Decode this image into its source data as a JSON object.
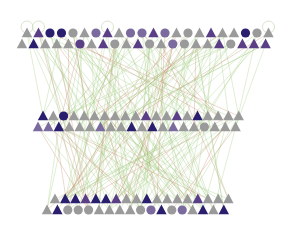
{
  "diagram": {
    "type": "multi-layer network graph",
    "width": 296,
    "height": 230,
    "background": "#ffffff",
    "colors": {
      "gray": "#9a9a9a",
      "light_purple": "#7b6a9e",
      "purple": "#5a3f86",
      "navy": "#2a1f6e",
      "edge_green": "#a8cf8a",
      "edge_red": "#c98b6a",
      "self_loop": "#c8d9b8"
    },
    "layers": [
      {
        "name": "top",
        "rows": [
          {
            "y": 33,
            "x_start": 27,
            "x_step": 11.5,
            "nodes": [
              {
                "shape": "triangle",
                "color": "gray",
                "loop": true
              },
              {
                "shape": "triangle",
                "color": "purple",
                "loop": true
              },
              {
                "shape": "circle",
                "color": "navy"
              },
              {
                "shape": "circle",
                "color": "navy"
              },
              {
                "shape": "circle",
                "color": "gray"
              },
              {
                "shape": "triangle",
                "color": "gray"
              },
              {
                "shape": "circle",
                "color": "light_purple"
              },
              {
                "shape": "triangle",
                "color": "purple",
                "loop": true
              },
              {
                "shape": "triangle",
                "color": "gray"
              },
              {
                "shape": "circle",
                "color": "light_purple"
              },
              {
                "shape": "circle",
                "color": "light_purple"
              },
              {
                "shape": "triangle",
                "color": "purple"
              },
              {
                "shape": "circle",
                "color": "light_purple"
              },
              {
                "shape": "triangle",
                "color": "gray"
              },
              {
                "shape": "circle",
                "color": "gray"
              },
              {
                "shape": "triangle",
                "color": "gray"
              },
              {
                "shape": "triangle",
                "color": "purple"
              },
              {
                "shape": "triangle",
                "color": "gray"
              },
              {
                "shape": "triangle",
                "color": "gray"
              },
              {
                "shape": "circle",
                "color": "navy"
              },
              {
                "shape": "circle",
                "color": "gray"
              },
              {
                "shape": "triangle",
                "color": "gray",
                "loop": true
              }
            ]
          },
          {
            "y": 44,
            "x_start": 22,
            "x_step": 11.6,
            "nodes": [
              {
                "shape": "triangle",
                "color": "gray"
              },
              {
                "shape": "triangle",
                "color": "navy"
              },
              {
                "shape": "triangle",
                "color": "gray"
              },
              {
                "shape": "triangle",
                "color": "gray"
              },
              {
                "shape": "triangle",
                "color": "gray"
              },
              {
                "shape": "circle",
                "color": "purple"
              },
              {
                "shape": "triangle",
                "color": "gray"
              },
              {
                "shape": "triangle",
                "color": "purple"
              },
              {
                "shape": "circle",
                "color": "gray"
              },
              {
                "shape": "triangle",
                "color": "gray"
              },
              {
                "shape": "triangle",
                "color": "purple"
              },
              {
                "shape": "circle",
                "color": "gray"
              },
              {
                "shape": "triangle",
                "color": "gray"
              },
              {
                "shape": "circle",
                "color": "light_purple"
              },
              {
                "shape": "circle",
                "color": "gray"
              },
              {
                "shape": "triangle",
                "color": "gray"
              },
              {
                "shape": "triangle",
                "color": "gray"
              },
              {
                "shape": "triangle",
                "color": "purple"
              },
              {
                "shape": "circle",
                "color": "gray"
              },
              {
                "shape": "triangle",
                "color": "purple"
              },
              {
                "shape": "triangle",
                "color": "purple"
              },
              {
                "shape": "triangle",
                "color": "purple"
              }
            ]
          }
        ]
      },
      {
        "name": "middle",
        "rows": [
          {
            "y": 116,
            "x_start": 43,
            "x_step": 10.3,
            "nodes": [
              {
                "shape": "triangle",
                "color": "navy"
              },
              {
                "shape": "triangle",
                "color": "gray"
              },
              {
                "shape": "circle",
                "color": "navy"
              },
              {
                "shape": "triangle",
                "color": "gray"
              },
              {
                "shape": "triangle",
                "color": "gray"
              },
              {
                "shape": "triangle",
                "color": "gray"
              },
              {
                "shape": "triangle",
                "color": "gray"
              },
              {
                "shape": "triangle",
                "color": "gray"
              },
              {
                "shape": "triangle",
                "color": "gray"
              },
              {
                "shape": "triangle",
                "color": "gray"
              },
              {
                "shape": "triangle",
                "color": "purple"
              },
              {
                "shape": "triangle",
                "color": "gray"
              },
              {
                "shape": "triangle",
                "color": "gray"
              },
              {
                "shape": "triangle",
                "color": "purple"
              },
              {
                "shape": "triangle",
                "color": "gray"
              },
              {
                "shape": "triangle",
                "color": "navy"
              },
              {
                "shape": "triangle",
                "color": "gray"
              },
              {
                "shape": "triangle",
                "color": "gray"
              },
              {
                "shape": "triangle",
                "color": "gray"
              },
              {
                "shape": "triangle",
                "color": "gray"
              }
            ]
          },
          {
            "y": 127,
            "x_start": 38,
            "x_step": 10.4,
            "nodes": [
              {
                "shape": "triangle",
                "color": "light_purple"
              },
              {
                "shape": "triangle",
                "color": "light_purple"
              },
              {
                "shape": "triangle",
                "color": "navy"
              },
              {
                "shape": "triangle",
                "color": "gray"
              },
              {
                "shape": "triangle",
                "color": "gray"
              },
              {
                "shape": "triangle",
                "color": "gray"
              },
              {
                "shape": "triangle",
                "color": "light_purple"
              },
              {
                "shape": "triangle",
                "color": "gray"
              },
              {
                "shape": "triangle",
                "color": "gray"
              },
              {
                "shape": "triangle",
                "color": "navy"
              },
              {
                "shape": "triangle",
                "color": "gray"
              },
              {
                "shape": "triangle",
                "color": "navy"
              },
              {
                "shape": "triangle",
                "color": "gray"
              },
              {
                "shape": "triangle",
                "color": "light_purple"
              },
              {
                "shape": "triangle",
                "color": "gray"
              },
              {
                "shape": "triangle",
                "color": "gray"
              },
              {
                "shape": "circle",
                "color": "gray"
              },
              {
                "shape": "triangle",
                "color": "gray"
              },
              {
                "shape": "triangle",
                "color": "gray"
              },
              {
                "shape": "triangle",
                "color": "gray"
              }
            ]
          }
        ]
      },
      {
        "name": "bottom",
        "rows": [
          {
            "y": 199,
            "x_start": 55,
            "x_step": 10.2,
            "nodes": [
              {
                "shape": "triangle",
                "color": "gray"
              },
              {
                "shape": "triangle",
                "color": "navy"
              },
              {
                "shape": "triangle",
                "color": "navy"
              },
              {
                "shape": "triangle",
                "color": "purple"
              },
              {
                "shape": "triangle",
                "color": "navy"
              },
              {
                "shape": "triangle",
                "color": "navy"
              },
              {
                "shape": "triangle",
                "color": "purple"
              },
              {
                "shape": "triangle",
                "color": "gray"
              },
              {
                "shape": "triangle",
                "color": "gray"
              },
              {
                "shape": "triangle",
                "color": "navy"
              },
              {
                "shape": "triangle",
                "color": "gray"
              },
              {
                "shape": "triangle",
                "color": "gray"
              },
              {
                "shape": "triangle",
                "color": "gray"
              },
              {
                "shape": "triangle",
                "color": "gray"
              },
              {
                "shape": "triangle",
                "color": "purple"
              },
              {
                "shape": "triangle",
                "color": "gray"
              },
              {
                "shape": "triangle",
                "color": "gray"
              },
              {
                "shape": "triangle",
                "color": "gray"
              }
            ]
          },
          {
            "y": 210,
            "x_start": 47,
            "x_step": 10.4,
            "nodes": [
              {
                "shape": "triangle",
                "color": "gray"
              },
              {
                "shape": "triangle",
                "color": "navy"
              },
              {
                "shape": "circle",
                "color": "gray"
              },
              {
                "shape": "circle",
                "color": "gray"
              },
              {
                "shape": "circle",
                "color": "gray"
              },
              {
                "shape": "triangle",
                "color": "gray"
              },
              {
                "shape": "triangle",
                "color": "gray"
              },
              {
                "shape": "triangle",
                "color": "gray"
              },
              {
                "shape": "triangle",
                "color": "gray"
              },
              {
                "shape": "circle",
                "color": "gray"
              },
              {
                "shape": "circle",
                "color": "light_purple"
              },
              {
                "shape": "triangle",
                "color": "navy"
              },
              {
                "shape": "circle",
                "color": "gray"
              },
              {
                "shape": "circle",
                "color": "light_purple"
              },
              {
                "shape": "triangle",
                "color": "gray"
              },
              {
                "shape": "triangle",
                "color": "navy"
              },
              {
                "shape": "triangle",
                "color": "gray"
              },
              {
                "shape": "triangle",
                "color": "navy"
              }
            ]
          }
        ]
      }
    ],
    "edges": {
      "count_green": 160,
      "count_red": 40,
      "seed": 7
    }
  }
}
